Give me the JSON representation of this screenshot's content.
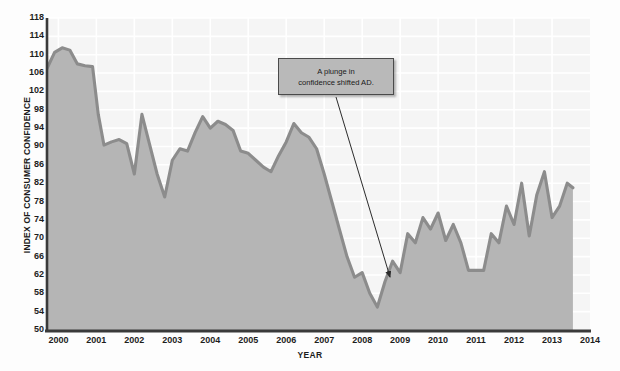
{
  "chart_data": {
    "type": "area",
    "title": "",
    "xlabel": "YEAR",
    "ylabel": "INDEX OF CONSUMER CONFIDENCE",
    "ylim": [
      50,
      118
    ],
    "xlim": [
      1999.7,
      2014.0
    ],
    "y_ticks": [
      118,
      114,
      110,
      106,
      102,
      98,
      94,
      90,
      86,
      82,
      78,
      74,
      70,
      66,
      62,
      58,
      54,
      50
    ],
    "x_ticks": [
      "2000",
      "2001",
      "2002",
      "2003",
      "2004",
      "2005",
      "2006",
      "2007",
      "2008",
      "2009",
      "2010",
      "2011",
      "2012",
      "2013",
      "2014"
    ],
    "grid": true,
    "legend": "none",
    "series": [
      {
        "name": "Index of Consumer Confidence",
        "x": [
          1999.7,
          1999.9,
          2000.1,
          2000.3,
          2000.5,
          2000.7,
          2000.9,
          2001.05,
          2001.2,
          2001.4,
          2001.6,
          2001.8,
          2002.0,
          2002.2,
          2002.4,
          2002.6,
          2002.8,
          2003.0,
          2003.2,
          2003.4,
          2003.6,
          2003.8,
          2004.0,
          2004.2,
          2004.4,
          2004.6,
          2004.8,
          2005.0,
          2005.2,
          2005.4,
          2005.6,
          2005.8,
          2006.0,
          2006.2,
          2006.4,
          2006.6,
          2006.8,
          2007.0,
          2007.2,
          2007.4,
          2007.6,
          2007.8,
          2008.0,
          2008.2,
          2008.4,
          2008.6,
          2008.8,
          2009.0,
          2009.2,
          2009.4,
          2009.6,
          2009.8,
          2010.0,
          2010.2,
          2010.4,
          2010.6,
          2010.8,
          2011.0,
          2011.2,
          2011.4,
          2011.6,
          2011.8,
          2012.0,
          2012.2,
          2012.4,
          2012.6,
          2012.8,
          2013.0,
          2013.2,
          2013.4,
          2013.55
        ],
        "values": [
          107.0,
          110.5,
          111.5,
          111.0,
          108.0,
          107.6,
          107.4,
          97.0,
          90.3,
          91.0,
          91.5,
          90.6,
          84.0,
          97.0,
          90.5,
          84.0,
          79.0,
          87.0,
          89.5,
          89.0,
          93.0,
          96.5,
          94.0,
          95.5,
          94.8,
          93.5,
          89.0,
          88.5,
          87.0,
          85.5,
          84.5,
          88.0,
          91.0,
          95.0,
          93.0,
          92.0,
          89.5,
          84.0,
          78.0,
          72.0,
          66.0,
          61.5,
          62.5,
          58.0,
          55.0,
          60.5,
          65.0,
          62.5,
          71.0,
          69.0,
          74.5,
          72.0,
          75.5,
          69.5,
          73.0,
          69.0,
          63.0,
          63.0,
          63.0,
          71.0,
          69.0,
          77.0,
          73.0,
          82.0,
          70.5,
          79.5,
          84.5,
          74.5,
          77.0,
          82.0,
          81.0
        ]
      }
    ],
    "annotations": [
      {
        "text": "A plunge in\nconfidence shifted AD.",
        "box_color": "#b9b9b9",
        "arrow_from": [
          336,
          96
        ],
        "arrow_to": [
          390,
          278
        ]
      }
    ],
    "colors": {
      "area_fill": "#b5b5b5",
      "line": "#8c8c8c",
      "grid": "#ffffff",
      "plot_background": "#f5f5f5",
      "axis": "#3a3a3a",
      "text": "#1d1d1d"
    }
  }
}
